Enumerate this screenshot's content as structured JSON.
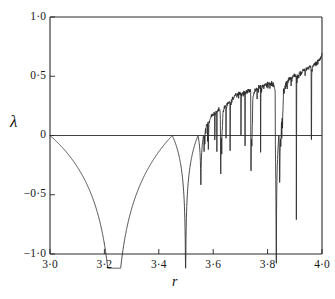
{
  "figure": {
    "title": "",
    "background_color": "#ffffff",
    "line_color": "#2b2b2b",
    "axis_color": "#2b2b2b"
  },
  "axes": {
    "x_axis_title": "r",
    "y_axis_title": "λ",
    "x_tick_labels": [
      "3·0",
      "3·2",
      "3·4",
      "3·6",
      "3·8",
      "4·0"
    ],
    "x_tick_values": [
      3.0,
      3.2,
      3.4,
      3.6,
      3.8,
      4.0
    ],
    "y_tick_labels": [
      "1·0",
      "0·5",
      "0",
      "−0·5",
      "−1·0"
    ],
    "y_tick_values": [
      1.0,
      0.5,
      0.0,
      -0.5,
      -1.0
    ]
  },
  "chart_data": {
    "type": "line",
    "title": "",
    "xlabel": "r",
    "ylabel": "λ",
    "xlim": [
      3.0,
      4.0
    ],
    "ylim": [
      -1.0,
      1.0
    ],
    "grid": false,
    "legend": null,
    "map_formula": "x_{n+1} = r * x_n * (1 - x_n)",
    "lyapunov_formula": "lambda = mean(log|r*(1-2x)|)",
    "zero_line_y": 0.0,
    "annotations": [
      {
        "r": 3.0,
        "lambda": 0.0,
        "note": "period-2 onset, lambda = 0"
      },
      {
        "r": 3.236,
        "lambda": -2.0,
        "note": "superstable period-2, lambda -> -infinity"
      },
      {
        "r": 3.449,
        "lambda": 0.0,
        "note": "period-4 onset, lambda = 0"
      },
      {
        "r": 3.4986,
        "lambda": -0.86,
        "note": "superstable period-4 dip"
      },
      {
        "r": 3.5441,
        "lambda": -0.35,
        "note": "period-8 dip"
      },
      {
        "r": 3.5699,
        "lambda": 0.0,
        "note": "Feigenbaum accumulation point, chaos onset"
      },
      {
        "r": 3.6265,
        "lambda": -0.52,
        "note": "period-6 window"
      },
      {
        "r": 3.7418,
        "lambda": -0.55,
        "note": "period-5 window"
      },
      {
        "r": 3.8284,
        "lambda": -0.75,
        "note": "period-3 window, deepest spike"
      },
      {
        "r": 4.0,
        "lambda": 0.693,
        "note": "fully chaotic, lambda = ln 2"
      }
    ],
    "series": [
      {
        "name": "lambda(r)",
        "color": "#2b2b2b",
        "computed": true,
        "sample_count": 1400
      }
    ]
  },
  "geometry": {
    "plot_left": 50,
    "plot_right": 322,
    "plot_top": 17,
    "plot_bottom": 254,
    "tick_length": 5
  }
}
